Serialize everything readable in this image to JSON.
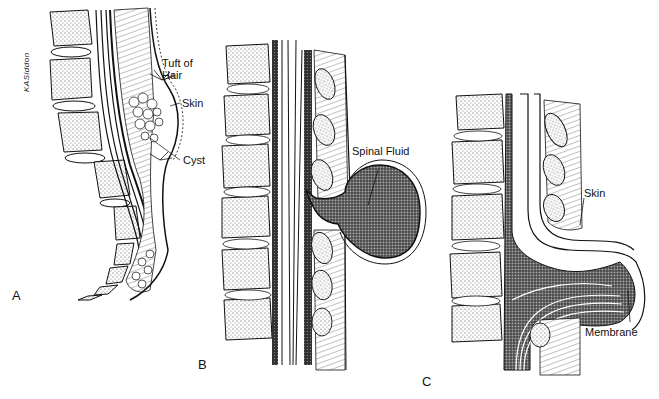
{
  "figure": {
    "signature": "KASiddon",
    "panels": [
      {
        "letter": "A",
        "labels": [
          "Tuft of Hair",
          "Skin",
          "Cyst"
        ]
      },
      {
        "letter": "B",
        "labels": [
          "Spinal Fluid"
        ]
      },
      {
        "letter": "C",
        "labels": [
          "Skin",
          "Membrane"
        ]
      }
    ]
  },
  "labels": {
    "a_tuft_line1": "Tuft of",
    "a_tuft_line2": "Hair",
    "a_skin": "Skin",
    "a_cyst": "Cyst",
    "b_spinal_fluid": "Spinal Fluid",
    "c_skin": "Skin",
    "c_membrane": "Membrane",
    "letter_a": "A",
    "letter_b": "B",
    "letter_c": "C",
    "signature": "KASiddon"
  },
  "colors": {
    "ink": "#111111",
    "background": "#ffffff",
    "stipple": "#555555"
  }
}
